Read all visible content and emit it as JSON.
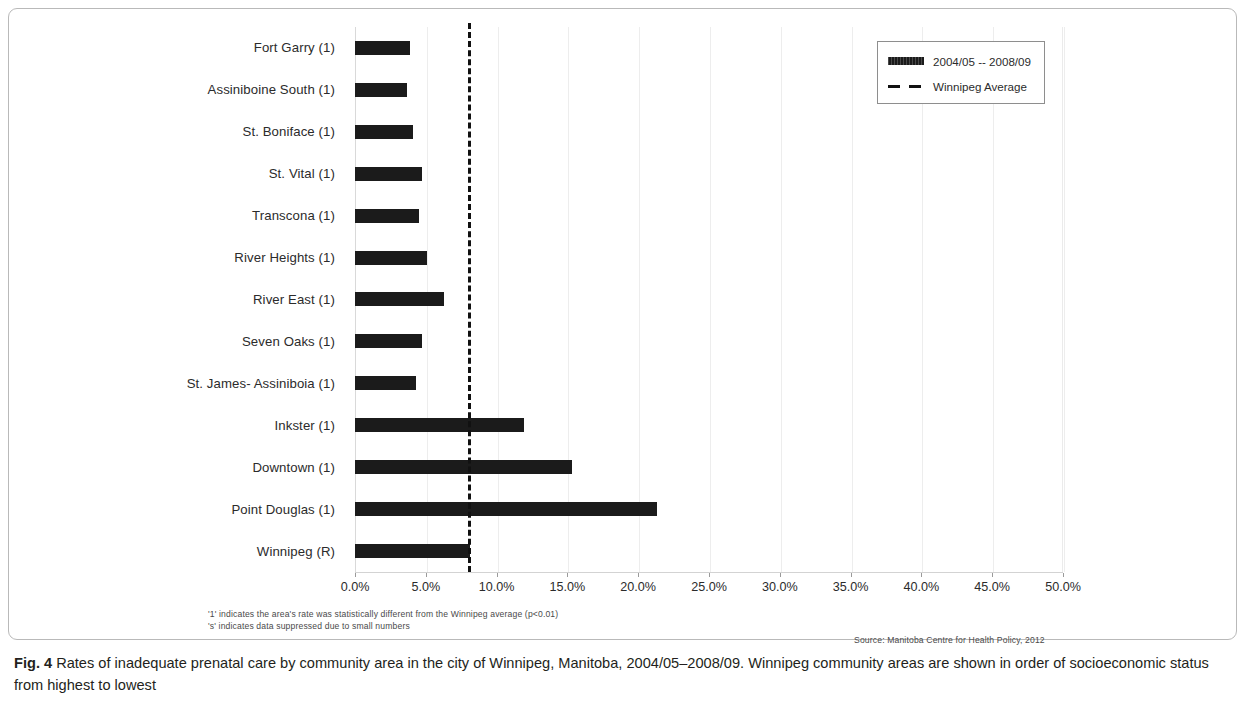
{
  "figure": {
    "caption_label": "Fig. 4",
    "caption_text": " Rates of inadequate prenatal care by community area in the city of Winnipeg, Manitoba, 2004/05–2008/09. Winnipeg community areas are shown in order of socioeconomic status from highest to lowest"
  },
  "notes": {
    "footnote_1": "'1' indicates the area's rate was statistically different from the Winnipeg average (p<0.01)",
    "footnote_2": "'s' indicates data suppressed due to small numbers",
    "source": "Source: Manitoba Centre for Health Policy, 2012"
  },
  "legend": {
    "series_label": "2004/05 -- 2008/09",
    "average_label": "Winnipeg Average"
  },
  "chart_data": {
    "type": "bar",
    "orientation": "horizontal",
    "title": "",
    "xlabel": "",
    "ylabel": "",
    "xlim": [
      0,
      50
    ],
    "xtick_labels": [
      "0.0%",
      "5.0%",
      "10.0%",
      "15.0%",
      "20.0%",
      "25.0%",
      "30.0%",
      "35.0%",
      "40.0%",
      "45.0%",
      "50.0%"
    ],
    "xtick_values": [
      0,
      5,
      10,
      15,
      20,
      25,
      30,
      35,
      40,
      45,
      50
    ],
    "grid": true,
    "legend_position": "top-right",
    "categories": [
      "Fort Garry (1)",
      "Assiniboine South (1)",
      "St. Boniface (1)",
      "St. Vital (1)",
      "Transcona (1)",
      "River Heights (1)",
      "River East (1)",
      "Seven Oaks (1)",
      "St. James- Assiniboia (1)",
      "Inkster (1)",
      "Downtown (1)",
      "Point Douglas (1)",
      "Winnipeg (R)"
    ],
    "series": [
      {
        "name": "2004/05 -- 2008/09",
        "values": [
          3.9,
          3.7,
          4.1,
          4.7,
          4.5,
          5.1,
          6.3,
          4.7,
          4.3,
          11.9,
          15.3,
          21.3,
          8.1
        ]
      }
    ],
    "annotations": [
      {
        "type": "reference-line",
        "label": "Winnipeg Average",
        "value": 8.0,
        "style": "dashed"
      }
    ],
    "colors": {
      "bar": "#1b1b1b",
      "average_line": "#111111",
      "grid": "#ededed",
      "text": "#2b2b2b"
    }
  }
}
